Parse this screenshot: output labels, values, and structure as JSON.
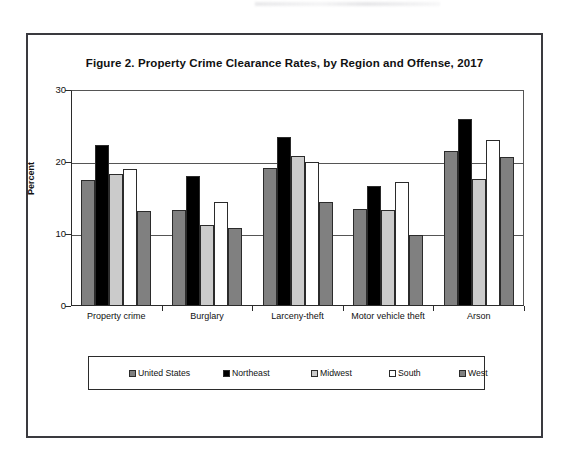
{
  "figure": {
    "title": "Figure 2. Property Crime Clearance Rates, by Region and Offense, 2017"
  },
  "axes": {
    "ylabel": "Percent",
    "yticks": [
      "0",
      "10",
      "20",
      "30"
    ]
  },
  "legend": {
    "items": [
      {
        "label": "United States",
        "color": "#808080",
        "icon": "legend-swatch-icon"
      },
      {
        "label": "Northeast",
        "color": "#000000",
        "icon": "legend-swatch-icon"
      },
      {
        "label": "Midwest",
        "color": "#cbcbcb",
        "icon": "legend-swatch-icon"
      },
      {
        "label": "South",
        "color": "#ffffff",
        "icon": "legend-swatch-icon"
      },
      {
        "label": "West",
        "color": "#808080",
        "icon": "legend-swatch-icon"
      }
    ]
  },
  "chart_data": {
    "type": "bar",
    "title": "Figure 2. Property Crime Clearance Rates, by Region and Offense, 2017",
    "xlabel": "",
    "ylabel": "Percent",
    "ylim": [
      0,
      30
    ],
    "yticks": [
      0,
      10,
      20,
      30
    ],
    "grid": true,
    "legend_position": "bottom",
    "categories": [
      "Property crime",
      "Burglary",
      "Larceny-theft",
      "Motor vehicle theft",
      "Arson"
    ],
    "series": [
      {
        "name": "United States",
        "color": "#808080",
        "values": [
          17.5,
          13.4,
          19.1,
          13.5,
          21.5
        ]
      },
      {
        "name": "Northeast",
        "color": "#000000",
        "values": [
          22.3,
          18.1,
          23.5,
          16.6,
          26.0
        ]
      },
      {
        "name": "Midwest",
        "color": "#cbcbcb",
        "values": [
          18.4,
          11.2,
          20.8,
          13.4,
          17.7
        ]
      },
      {
        "name": "South",
        "color": "#ffffff",
        "values": [
          19.0,
          14.5,
          20.0,
          17.2,
          23.0
        ]
      },
      {
        "name": "West",
        "color": "#808080",
        "values": [
          13.2,
          10.8,
          14.5,
          9.8,
          20.7
        ]
      }
    ]
  }
}
